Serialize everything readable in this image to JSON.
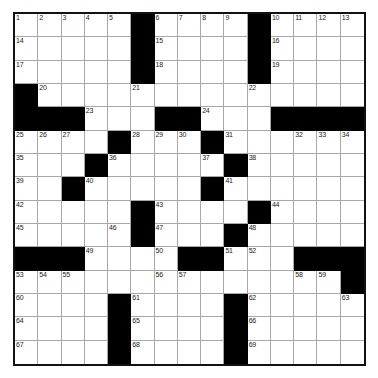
{
  "puzzle": {
    "title": "Crossword Grid",
    "size": 15,
    "rows": 15,
    "cols": 15,
    "colors": {
      "block": "#000000",
      "fill": "#ffffff",
      "gridline": "#a8a8a8",
      "border": "#111111",
      "number_text": "#1a1a1a"
    },
    "blocks": [
      [
        1,
        6
      ],
      [
        1,
        11
      ],
      [
        2,
        6
      ],
      [
        2,
        11
      ],
      [
        3,
        6
      ],
      [
        3,
        11
      ],
      [
        4,
        1
      ],
      [
        5,
        1
      ],
      [
        5,
        2
      ],
      [
        5,
        3
      ],
      [
        5,
        7
      ],
      [
        5,
        8
      ],
      [
        5,
        12
      ],
      [
        5,
        13
      ],
      [
        5,
        14
      ],
      [
        5,
        15
      ],
      [
        6,
        5
      ],
      [
        6,
        9
      ],
      [
        7,
        4
      ],
      [
        7,
        10
      ],
      [
        8,
        3
      ],
      [
        8,
        9
      ],
      [
        9,
        6
      ],
      [
        9,
        11
      ],
      [
        10,
        6
      ],
      [
        10,
        10
      ],
      [
        11,
        1
      ],
      [
        11,
        2
      ],
      [
        11,
        3
      ],
      [
        11,
        8
      ],
      [
        11,
        9
      ],
      [
        11,
        13
      ],
      [
        11,
        14
      ],
      [
        11,
        15
      ],
      [
        12,
        15
      ],
      [
        13,
        5
      ],
      [
        13,
        10
      ],
      [
        14,
        5
      ],
      [
        14,
        10
      ],
      [
        15,
        5
      ],
      [
        15,
        10
      ]
    ],
    "numbers": [
      {
        "n": 1,
        "r": 1,
        "c": 1
      },
      {
        "n": 2,
        "r": 1,
        "c": 2
      },
      {
        "n": 3,
        "r": 1,
        "c": 3
      },
      {
        "n": 4,
        "r": 1,
        "c": 4
      },
      {
        "n": 5,
        "r": 1,
        "c": 5
      },
      {
        "n": 6,
        "r": 1,
        "c": 7
      },
      {
        "n": 7,
        "r": 1,
        "c": 8
      },
      {
        "n": 8,
        "r": 1,
        "c": 9
      },
      {
        "n": 9,
        "r": 1,
        "c": 10
      },
      {
        "n": 10,
        "r": 1,
        "c": 12
      },
      {
        "n": 11,
        "r": 1,
        "c": 13
      },
      {
        "n": 12,
        "r": 1,
        "c": 14
      },
      {
        "n": 13,
        "r": 1,
        "c": 15
      },
      {
        "n": 14,
        "r": 2,
        "c": 1
      },
      {
        "n": 15,
        "r": 2,
        "c": 7
      },
      {
        "n": 16,
        "r": 2,
        "c": 12
      },
      {
        "n": 17,
        "r": 3,
        "c": 1
      },
      {
        "n": 18,
        "r": 3,
        "c": 7
      },
      {
        "n": 19,
        "r": 3,
        "c": 12
      },
      {
        "n": 20,
        "r": 4,
        "c": 2
      },
      {
        "n": 21,
        "r": 4,
        "c": 6
      },
      {
        "n": 22,
        "r": 4,
        "c": 11
      },
      {
        "n": 23,
        "r": 5,
        "c": 4
      },
      {
        "n": 24,
        "r": 5,
        "c": 9
      },
      {
        "n": 25,
        "r": 6,
        "c": 1
      },
      {
        "n": 26,
        "r": 6,
        "c": 2
      },
      {
        "n": 27,
        "r": 6,
        "c": 3
      },
      {
        "n": 28,
        "r": 6,
        "c": 6
      },
      {
        "n": 29,
        "r": 6,
        "c": 7
      },
      {
        "n": 30,
        "r": 6,
        "c": 8
      },
      {
        "n": 31,
        "r": 6,
        "c": 10
      },
      {
        "n": 32,
        "r": 6,
        "c": 13
      },
      {
        "n": 33,
        "r": 6,
        "c": 14
      },
      {
        "n": 34,
        "r": 6,
        "c": 15
      },
      {
        "n": 35,
        "r": 7,
        "c": 1
      },
      {
        "n": 36,
        "r": 7,
        "c": 5
      },
      {
        "n": 37,
        "r": 7,
        "c": 9
      },
      {
        "n": 38,
        "r": 7,
        "c": 11
      },
      {
        "n": 39,
        "r": 8,
        "c": 1
      },
      {
        "n": 40,
        "r": 8,
        "c": 4
      },
      {
        "n": 41,
        "r": 8,
        "c": 10
      },
      {
        "n": 42,
        "r": 9,
        "c": 1
      },
      {
        "n": 43,
        "r": 9,
        "c": 7
      },
      {
        "n": 44,
        "r": 9,
        "c": 12
      },
      {
        "n": 45,
        "r": 10,
        "c": 1
      },
      {
        "n": 46,
        "r": 10,
        "c": 5
      },
      {
        "n": 47,
        "r": 10,
        "c": 7
      },
      {
        "n": 48,
        "r": 10,
        "c": 11
      },
      {
        "n": 49,
        "r": 11,
        "c": 4
      },
      {
        "n": 50,
        "r": 11,
        "c": 7
      },
      {
        "n": 51,
        "r": 11,
        "c": 10
      },
      {
        "n": 52,
        "r": 11,
        "c": 11
      },
      {
        "n": 53,
        "r": 12,
        "c": 1
      },
      {
        "n": 54,
        "r": 12,
        "c": 2
      },
      {
        "n": 55,
        "r": 12,
        "c": 3
      },
      {
        "n": 56,
        "r": 12,
        "c": 7
      },
      {
        "n": 57,
        "r": 12,
        "c": 8
      },
      {
        "n": 58,
        "r": 12,
        "c": 13
      },
      {
        "n": 59,
        "r": 12,
        "c": 14
      },
      {
        "n": 60,
        "r": 13,
        "c": 1
      },
      {
        "n": 61,
        "r": 13,
        "c": 6
      },
      {
        "n": 62,
        "r": 13,
        "c": 11
      },
      {
        "n": 63,
        "r": 13,
        "c": 15
      },
      {
        "n": 64,
        "r": 14,
        "c": 1
      },
      {
        "n": 65,
        "r": 14,
        "c": 6
      },
      {
        "n": 66,
        "r": 14,
        "c": 11
      },
      {
        "n": 67,
        "r": 15,
        "c": 1
      },
      {
        "n": 68,
        "r": 15,
        "c": 6
      },
      {
        "n": 69,
        "r": 15,
        "c": 11
      }
    ]
  }
}
